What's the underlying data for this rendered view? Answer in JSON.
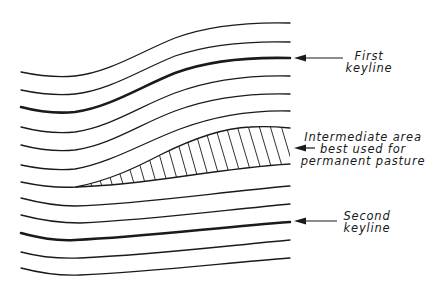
{
  "diagram": {
    "type": "contour-keyline-diagram",
    "colors": {
      "line": "#1a1a1a",
      "background": "#ffffff"
    },
    "labels": {
      "first_keyline": {
        "line1": "First",
        "line2": "keyline"
      },
      "intermediate_area": {
        "line1": "Intermediate area",
        "line2": "best used for",
        "line3": "permanent pasture"
      },
      "second_keyline": {
        "line1": "Second",
        "line2": "keyline"
      }
    },
    "contour_lines": [
      {
        "index": 1,
        "type": "contour"
      },
      {
        "index": 2,
        "type": "contour"
      },
      {
        "index": 3,
        "type": "keyline",
        "label": "First keyline"
      },
      {
        "index": 4,
        "type": "contour"
      },
      {
        "index": 5,
        "type": "contour"
      },
      {
        "index": 6,
        "type": "contour"
      },
      {
        "index": 7,
        "type": "contour",
        "note": "upper boundary of hatched area"
      },
      {
        "index": 8,
        "type": "contour",
        "note": "lower boundary of hatched area"
      },
      {
        "index": 9,
        "type": "contour"
      },
      {
        "index": 10,
        "type": "contour"
      },
      {
        "index": 11,
        "type": "keyline",
        "label": "Second keyline"
      },
      {
        "index": 12,
        "type": "contour"
      },
      {
        "index": 13,
        "type": "contour"
      }
    ],
    "hatched_region": "Intermediate area best used for permanent pasture"
  }
}
